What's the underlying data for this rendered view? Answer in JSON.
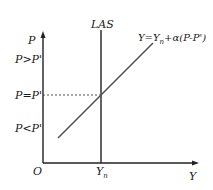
{
  "diagram": {
    "axes": {
      "y_label": "P",
      "x_label": "Y",
      "origin_label": "O"
    },
    "price_levels": [
      {
        "label": "P>P'"
      },
      {
        "label": "P=P'"
      },
      {
        "label": "P<P'"
      }
    ],
    "vertical_curve": {
      "label": "LAS"
    },
    "x_tick": {
      "main": "Y",
      "sub": "n"
    },
    "sloped_curve": {
      "label_pre": "Y=Y",
      "label_sub": "n",
      "label_post": "+α(P-P')"
    },
    "colors": {
      "axes": "#222222",
      "las_line": "#222222",
      "supply_line": "#555555",
      "dashed": "#444444"
    }
  }
}
